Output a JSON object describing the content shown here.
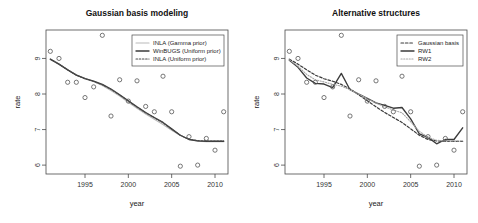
{
  "figure": {
    "background": "#ffffff",
    "panel_count": 2
  },
  "chart_data": [
    {
      "type": "scatter",
      "title": "Gaussian basis modeling",
      "xlabel": "year",
      "ylabel": "rate",
      "xlim": [
        1990.5,
        2011.5
      ],
      "ylim": [
        5.75,
        9.8
      ],
      "xticks": [
        1995,
        2000,
        2005,
        2010
      ],
      "yticks": [
        6,
        7,
        8,
        9
      ],
      "grid": false,
      "legend_position": "top-right",
      "x": [
        1991,
        1992,
        1993,
        1994,
        1995,
        1996,
        1997,
        1998,
        1999,
        2000,
        2001,
        2002,
        2003,
        2004,
        2005,
        2006,
        2007,
        2008,
        2009,
        2010,
        2011
      ],
      "points": [
        9.2,
        9.0,
        8.33,
        8.33,
        7.9,
        8.2,
        9.65,
        7.38,
        8.4,
        7.8,
        8.37,
        7.65,
        7.5,
        8.5,
        7.5,
        5.97,
        6.8,
        6.0,
        6.75,
        6.42,
        7.5
      ],
      "series": [
        {
          "name": "INLA (Gamma prior)",
          "style": "solid-light",
          "color": "#b9b9b9",
          "values": [
            8.97,
            8.83,
            8.68,
            8.54,
            8.44,
            8.35,
            8.24,
            8.1,
            7.94,
            7.77,
            7.6,
            7.44,
            7.29,
            7.14,
            6.98,
            6.83,
            6.72,
            6.67,
            6.66,
            6.66,
            6.66
          ]
        },
        {
          "name": "WinBUGS (Uniform prior)",
          "style": "solid-dark",
          "color": "#3b3b3b",
          "values": [
            8.98,
            8.84,
            8.68,
            8.53,
            8.43,
            8.36,
            8.27,
            8.14,
            7.98,
            7.81,
            7.64,
            7.48,
            7.34,
            7.2,
            7.02,
            6.84,
            6.72,
            6.68,
            6.67,
            6.67,
            6.67
          ]
        },
        {
          "name": "INLA (Uniform prior)",
          "style": "dotted",
          "color": "#4a4a4a",
          "values": [
            8.98,
            8.84,
            8.68,
            8.53,
            8.43,
            8.35,
            8.26,
            8.13,
            7.97,
            7.8,
            7.63,
            7.47,
            7.33,
            7.19,
            7.01,
            6.84,
            6.73,
            6.69,
            6.68,
            6.68,
            6.68
          ]
        }
      ],
      "legend": [
        {
          "label": "INLA (Gamma prior)",
          "style": "solid-light",
          "color": "#b9b9b9"
        },
        {
          "label": "WinBUGS (Uniform prior)",
          "style": "solid-dark",
          "color": "#3b3b3b"
        },
        {
          "label": "INLA (Uniform prior)",
          "style": "dotted",
          "color": "#4a4a4a"
        }
      ]
    },
    {
      "type": "scatter",
      "title": "Alternative structures",
      "xlabel": "year",
      "ylabel": "rate",
      "xlim": [
        1990.5,
        2011.5
      ],
      "ylim": [
        5.75,
        9.8
      ],
      "xticks": [
        1995,
        2000,
        2005,
        2010
      ],
      "yticks": [
        6,
        7,
        8,
        9
      ],
      "grid": false,
      "legend_position": "top-right",
      "x": [
        1991,
        1992,
        1993,
        1994,
        1995,
        1996,
        1997,
        1998,
        1999,
        2000,
        2001,
        2002,
        2003,
        2004,
        2005,
        2006,
        2007,
        2008,
        2009,
        2010,
        2011
      ],
      "points": [
        9.2,
        9.0,
        8.33,
        8.33,
        7.9,
        8.2,
        9.65,
        7.38,
        8.4,
        7.8,
        8.37,
        7.65,
        7.5,
        8.5,
        7.5,
        5.97,
        6.8,
        6.0,
        6.75,
        6.42,
        7.5
      ],
      "series": [
        {
          "name": "Gaussian basis",
          "style": "dashed",
          "color": "#3b3b3b",
          "values": [
            8.98,
            8.84,
            8.68,
            8.53,
            8.43,
            8.36,
            8.27,
            8.14,
            7.98,
            7.81,
            7.64,
            7.48,
            7.34,
            7.2,
            7.02,
            6.84,
            6.72,
            6.68,
            6.67,
            6.67,
            6.67
          ]
        },
        {
          "name": "RW1",
          "style": "solid-dark",
          "color": "#3b3b3b",
          "values": [
            8.95,
            8.75,
            8.45,
            8.3,
            8.28,
            8.18,
            8.58,
            8.12,
            8.0,
            7.88,
            7.75,
            7.68,
            7.6,
            7.62,
            7.3,
            6.88,
            6.78,
            6.6,
            6.72,
            6.72,
            7.05
          ]
        },
        {
          "name": "RW2",
          "style": "dotted-light",
          "color": "#a8a8a8",
          "values": [
            8.96,
            8.78,
            8.55,
            8.4,
            8.34,
            8.27,
            8.22,
            8.12,
            8.0,
            7.87,
            7.74,
            7.64,
            7.55,
            7.47,
            7.22,
            6.95,
            6.78,
            6.7,
            6.68,
            6.68,
            6.68
          ]
        }
      ],
      "legend": [
        {
          "label": "Gaussian basis",
          "style": "dashed",
          "color": "#3b3b3b"
        },
        {
          "label": "RW1",
          "style": "solid-dark",
          "color": "#3b3b3b"
        },
        {
          "label": "RW2",
          "style": "dotted-light",
          "color": "#a8a8a8"
        }
      ]
    }
  ]
}
